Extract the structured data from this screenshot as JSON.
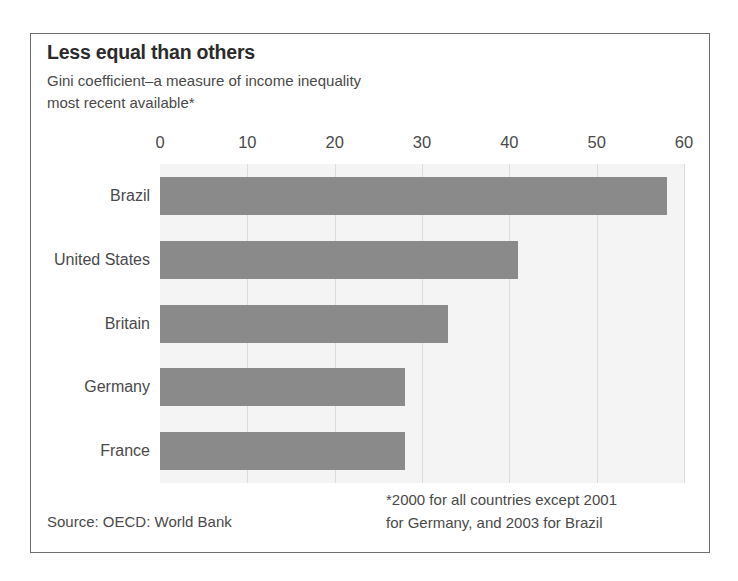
{
  "chart_data": {
    "type": "bar",
    "orientation": "horizontal",
    "title": "Less equal than others",
    "subtitle_lines": [
      "Gini coefficient–a measure of income inequality",
      "most recent available*"
    ],
    "categories": [
      "Brazil",
      "United States",
      "Britain",
      "Germany",
      "France"
    ],
    "values": [
      58,
      41,
      33,
      28,
      28
    ],
    "series": [
      {
        "name": "Gini coefficient",
        "values": [
          58,
          41,
          33,
          28,
          28
        ]
      }
    ],
    "xlabel": "",
    "ylabel": "",
    "xlim": [
      0,
      60
    ],
    "xticks": [
      0,
      10,
      20,
      30,
      40,
      50,
      60
    ],
    "xtick_labels": [
      "0",
      "10",
      "20",
      "30",
      "40",
      "50",
      "60"
    ],
    "grid": true,
    "grid_axis": "x",
    "legend": false,
    "bar_color": "#8a8a8a",
    "plot_background": "#f4f4f4",
    "gridline_color": "#dcdcdc"
  },
  "footer": {
    "source": "Source: OECD: World Bank",
    "footnote_lines": [
      "*2000 for all countries except 2001",
      "for Germany, and 2003 for Brazil"
    ]
  }
}
